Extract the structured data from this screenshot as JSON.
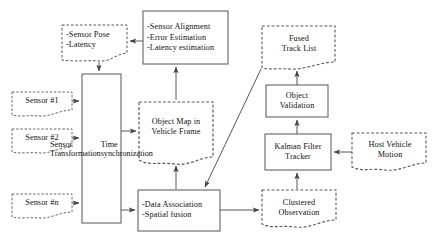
{
  "diagram": {
    "background_color": "#ffffff",
    "stroke_color": "#555555",
    "text_color": "#111111",
    "nodes": [
      {
        "id": "sensor_pose",
        "shape": "data-dashed",
        "lines": [
          "-Sensor Pose",
          "-Latency"
        ],
        "align": "left"
      },
      {
        "id": "sensor_alignment",
        "shape": "rect-solid",
        "lines": [
          "-Sensor Alignment",
          "-Error Estimation",
          "-Latency estimation"
        ],
        "align": "left"
      },
      {
        "id": "fused_track_list",
        "shape": "data-dashed",
        "lines": [
          "Fused",
          "Track List"
        ],
        "align": "center"
      },
      {
        "id": "sensor_1",
        "shape": "data-dashed",
        "lines": [
          "Sensor #1"
        ],
        "align": "center"
      },
      {
        "id": "sensor_2",
        "shape": "data-dashed",
        "lines": [
          "Sensor #2"
        ],
        "align": "center"
      },
      {
        "id": "sensor_n",
        "shape": "data-dashed",
        "lines": [
          "Sensor #n"
        ],
        "align": "center"
      },
      {
        "id": "sensor_transformation",
        "shape": "rect-solid-vertical",
        "lines": [
          "Sensor  Transformation",
          "Time synchronization"
        ],
        "align": "center"
      },
      {
        "id": "object_map",
        "shape": "data-dashed",
        "lines": [
          "Object Map in",
          "Vehicle Frame"
        ],
        "align": "center"
      },
      {
        "id": "object_validation",
        "shape": "rect-solid",
        "lines": [
          "Object",
          "Validation"
        ],
        "align": "center"
      },
      {
        "id": "kalman_filter_tracker",
        "shape": "rect-solid",
        "lines": [
          "Kalman Filter",
          "Tracker"
        ],
        "align": "center"
      },
      {
        "id": "host_vehicle_motion",
        "shape": "data-dashed",
        "lines": [
          "Host Vehicle",
          "Motion"
        ],
        "align": "center"
      },
      {
        "id": "data_association",
        "shape": "rect-solid",
        "lines": [
          "-Data Association",
          "-Spatial fusion"
        ],
        "align": "left"
      },
      {
        "id": "clustered_observation",
        "shape": "data-dashed",
        "lines": [
          "Clustered",
          "Observation"
        ],
        "align": "center"
      }
    ],
    "edges": [
      {
        "id": "alignment-to-pose",
        "from": "sensor_alignment",
        "to": "sensor_pose"
      },
      {
        "id": "pose-to-transformation",
        "from": "sensor_pose",
        "to": "sensor_transformation"
      },
      {
        "id": "objectmap-to-alignment",
        "from": "object_map",
        "to": "sensor_alignment"
      },
      {
        "id": "sensor1-to-transformation",
        "from": "sensor_1",
        "to": "sensor_transformation"
      },
      {
        "id": "sensor2-to-transformation",
        "from": "sensor_2",
        "to": "sensor_transformation"
      },
      {
        "id": "sensorn-to-transformation",
        "from": "sensor_n",
        "to": "sensor_transformation"
      },
      {
        "id": "transformation-to-objectmap",
        "from": "sensor_transformation",
        "to": "object_map"
      },
      {
        "id": "transformation-to-dataassociation",
        "from": "sensor_transformation",
        "to": "data_association"
      },
      {
        "id": "dataassociation-to-objectmap",
        "from": "data_association",
        "to": "object_map"
      },
      {
        "id": "dataassociation-to-clustered",
        "from": "data_association",
        "to": "clustered_observation"
      },
      {
        "id": "clustered-to-kalman",
        "from": "clustered_observation",
        "to": "kalman_filter_tracker"
      },
      {
        "id": "hostvehicle-to-kalman",
        "from": "host_vehicle_motion",
        "to": "kalman_filter_tracker"
      },
      {
        "id": "kalman-to-validation",
        "from": "kalman_filter_tracker",
        "to": "object_validation"
      },
      {
        "id": "validation-to-fused",
        "from": "object_validation",
        "to": "fused_track_list"
      },
      {
        "id": "fused-to-dataassociation",
        "from": "fused_track_list",
        "to": "data_association"
      }
    ]
  }
}
